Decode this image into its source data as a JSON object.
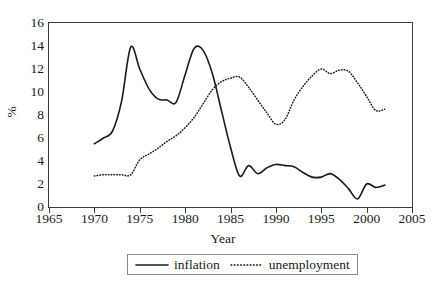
{
  "chart_data": {
    "type": "line",
    "title": "",
    "xlabel": "Year",
    "ylabel": "%",
    "xlim": [
      1965,
      2005
    ],
    "ylim": [
      0,
      16
    ],
    "xticks": [
      1965,
      1970,
      1975,
      1980,
      1985,
      1990,
      1995,
      2000,
      2005
    ],
    "xtick_labels": [
      "1965",
      "1970",
      "1975",
      "1980",
      "1985",
      "1990",
      "1995",
      "2000",
      "2005"
    ],
    "yticks": [
      0,
      2,
      4,
      6,
      8,
      10,
      12,
      14,
      16
    ],
    "ytick_labels": [
      "0",
      "2",
      "4",
      "6",
      "8",
      "10",
      "12",
      "14",
      "16"
    ],
    "grid": false,
    "legend_position": "bottom-center",
    "x": [
      1970,
      1971,
      1972,
      1973,
      1974,
      1975,
      1976,
      1977,
      1978,
      1979,
      1980,
      1981,
      1982,
      1983,
      1984,
      1985,
      1986,
      1987,
      1988,
      1989,
      1990,
      1991,
      1992,
      1993,
      1994,
      1995,
      1996,
      1997,
      1998,
      1999,
      2000,
      2001,
      2002
    ],
    "series": [
      {
        "name": "inflation",
        "style": "solid",
        "color": "#1a1a1a",
        "values": [
          5.5,
          6.0,
          6.6,
          9.2,
          13.9,
          12.0,
          10.3,
          9.4,
          9.3,
          9.1,
          11.5,
          13.8,
          13.6,
          11.6,
          8.4,
          5.2,
          2.7,
          3.6,
          2.9,
          3.4,
          3.7,
          3.6,
          3.5,
          3.0,
          2.6,
          2.6,
          2.9,
          2.4,
          1.6,
          0.7,
          2.0,
          1.7,
          1.9
        ]
      },
      {
        "name": "unemployment",
        "style": "dotted",
        "color": "#1a1a1a",
        "values": [
          2.7,
          2.8,
          2.8,
          2.8,
          2.8,
          4.1,
          4.6,
          5.1,
          5.7,
          6.2,
          6.9,
          7.8,
          9.0,
          10.2,
          10.9,
          11.2,
          11.3,
          10.4,
          9.3,
          8.2,
          7.2,
          7.6,
          9.3,
          10.5,
          11.4,
          12.0,
          11.6,
          11.9,
          11.8,
          10.8,
          9.6,
          8.4,
          8.5
        ]
      }
    ]
  },
  "legend": {
    "items": [
      {
        "label": "inflation",
        "style": "solid"
      },
      {
        "label": "unemployment",
        "style": "dotted"
      }
    ]
  }
}
